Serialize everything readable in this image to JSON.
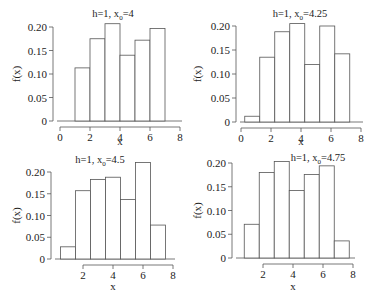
{
  "chart_data": [
    {
      "type": "bar",
      "title": "h=1, x0=4",
      "title_main": "h=1, x",
      "title_sub": "0",
      "title_tail": "=4",
      "xlabel": "x",
      "ylabel": "f(x)",
      "bin_width": 1,
      "bin_edges": [
        1,
        2,
        3,
        4,
        5,
        6,
        7
      ],
      "values": [
        0.113,
        0.175,
        0.207,
        0.14,
        0.172,
        0.197
      ],
      "xticks": [
        0,
        2,
        4,
        6,
        8
      ],
      "yticks": [
        0,
        0.05,
        0.1,
        0.15,
        0.2
      ],
      "ytick_labels": [
        "0",
        "0.05",
        "0.10",
        "0.15",
        "0.20"
      ],
      "xlim": [
        0,
        8
      ],
      "ylim": [
        0,
        0.2
      ],
      "grid": false
    },
    {
      "type": "bar",
      "title": "h=1, x0=4.25",
      "title_main": "h=1, x",
      "title_sub": "0",
      "title_tail": "=4.25",
      "xlabel": "x",
      "ylabel": "f(x)",
      "bin_width": 1,
      "bin_edges": [
        0.25,
        1.25,
        2.25,
        3.25,
        4.25,
        5.25,
        6.25,
        7.25
      ],
      "values": [
        0.012,
        0.135,
        0.188,
        0.205,
        0.12,
        0.2,
        0.142
      ],
      "xticks": [
        0,
        2,
        4,
        6,
        8
      ],
      "yticks": [
        0,
        0.05,
        0.1,
        0.15,
        0.2
      ],
      "ytick_labels": [
        "0",
        "0.05",
        "0.10",
        "0.15",
        "0.20"
      ],
      "xlim": [
        0,
        8
      ],
      "ylim": [
        0,
        0.2
      ],
      "grid": false
    },
    {
      "type": "bar",
      "title": "h=1, x0=4.5",
      "title_main": "h=1, x",
      "title_sub": "0",
      "title_tail": "=4.5",
      "xlabel": "x",
      "ylabel": "f(x)",
      "bin_width": 1,
      "bin_edges": [
        0.5,
        1.5,
        2.5,
        3.5,
        4.5,
        5.5,
        6.5,
        7.5
      ],
      "values": [
        0.028,
        0.157,
        0.183,
        0.188,
        0.137,
        0.222,
        0.078
      ],
      "xticks": [
        2,
        4,
        6,
        8
      ],
      "yticks": [
        0,
        0.05,
        0.1,
        0.15,
        0.2
      ],
      "ytick_labels": [
        "0",
        "0.05",
        "0.10",
        "0.15",
        "0.20"
      ],
      "xlim": [
        2,
        8
      ],
      "ylim": [
        0,
        0.2
      ],
      "grid": false
    },
    {
      "type": "bar",
      "title": "h=1, x0=4.75",
      "title_main": "h=1, x",
      "title_sub": "0",
      "title_tail": "=4.75",
      "xlabel": "x",
      "ylabel": "f(x)",
      "bin_width": 1,
      "bin_edges": [
        0.75,
        1.75,
        2.75,
        3.75,
        4.75,
        5.75,
        6.75,
        7.75
      ],
      "values": [
        0.071,
        0.18,
        0.203,
        0.142,
        0.176,
        0.194,
        0.036
      ],
      "xticks": [
        2,
        4,
        6,
        8
      ],
      "yticks": [
        0,
        0.05,
        0.1,
        0.15,
        0.2
      ],
      "ytick_labels": [
        "0",
        "0.05",
        "0.10",
        "0.15",
        "0.20"
      ],
      "xlim": [
        2,
        8
      ],
      "ylim": [
        0,
        0.2
      ],
      "grid": false
    }
  ],
  "layout": {
    "panels": [
      {
        "x0_px": 60,
        "px_per_x": 15,
        "base_y": 121,
        "top_y": 27,
        "yaxis_x": 53,
        "xaxis_y": 127,
        "title_x": 113,
        "title_y": 17,
        "ylab_x": 20,
        "xlab_y": 145
      },
      {
        "x0_px": 241,
        "px_per_x": 15,
        "base_y": 122,
        "top_y": 26,
        "yaxis_x": 236,
        "xaxis_y": 128,
        "title_x": 300,
        "title_y": 17,
        "ylab_x": 201,
        "xlab_y": 145
      },
      {
        "x0_px": 53,
        "px_per_x": 15,
        "base_y": 259,
        "top_y": 172,
        "yaxis_x": 51,
        "xaxis_y": 265,
        "title_x": 100,
        "title_y": 163,
        "ylab_x": 20,
        "xlab_y": 290
      },
      {
        "x0_px": 233,
        "px_per_x": 15,
        "base_y": 258,
        "top_y": 163,
        "yaxis_x": 232,
        "xaxis_y": 264,
        "title_x": 318,
        "title_y": 161,
        "ylab_x": 201,
        "xlab_y": 290
      }
    ]
  }
}
